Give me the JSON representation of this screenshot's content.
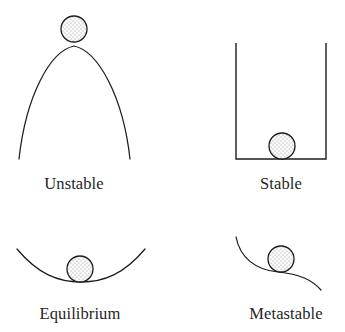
{
  "figure": {
    "background_color": "#ffffff",
    "ink_color": "#1c1c1c",
    "text_color": "#252525",
    "ball": {
      "fill_color": "#fbfbfb",
      "stipple_color": "#8d8d8d",
      "outline_color": "#1c1c1c",
      "radius": 13,
      "texture": "stipple-dots"
    }
  },
  "panels": [
    {
      "id": "unstable",
      "label": "Unstable",
      "label_x": 74,
      "label_y": 189,
      "icon_name": "ball-on-dome-icon",
      "description": "Ball balanced on the apex of a tall dome",
      "surface_path": "M 19 159 C 26 96 50 51 74 46 C 98 51 123 96 130 159",
      "ball_cx": 74,
      "ball_cy": 29,
      "ball_r": 13
    },
    {
      "id": "stable",
      "label": "Stable",
      "label_x": 281,
      "label_y": 189,
      "icon_name": "ball-in-container-icon",
      "description": "Ball resting at the flat bottom of an open container",
      "container_path": "M 236 43 L 236 159 L 326 159 L 326 43",
      "ball_cx": 282,
      "ball_cy": 146,
      "ball_r": 13
    },
    {
      "id": "equilibrium",
      "label": "Equilibrium",
      "label_x": 80,
      "label_y": 319,
      "icon_name": "ball-in-shallow-bowl-icon",
      "description": "Ball resting in a shallow concave bowl",
      "surface_path": "M 17 249 C 38 274 58 282 81 282 C 104 282 124 274 145 249",
      "ball_cx": 80,
      "ball_cy": 269,
      "ball_r": 13
    },
    {
      "id": "metastable",
      "label": "Metastable",
      "label_x": 286,
      "label_y": 319,
      "icon_name": "ball-on-ledge-icon",
      "description": "Ball resting on the flat ledge of a descending S-curve",
      "surface_path": "M 236 237 C 240 258 256 270 278 272 C 300 274 312 280 321 290",
      "ball_cx": 281,
      "ball_cy": 259,
      "ball_r": 13
    }
  ]
}
